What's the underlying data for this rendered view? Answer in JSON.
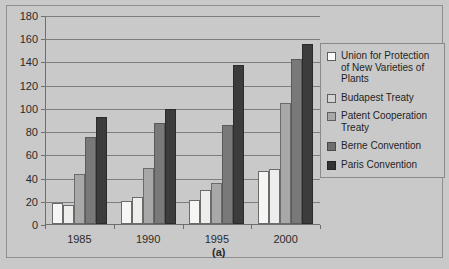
{
  "chart_data": {
    "type": "bar",
    "title": "",
    "subtitle": "",
    "caption": "(a)",
    "xlabel": "",
    "ylabel": "",
    "categories": [
      "1985",
      "1990",
      "1995",
      "2000"
    ],
    "ylim": [
      0,
      180
    ],
    "ytick_step": 20,
    "yticks": [
      "0",
      "20",
      "40",
      "60",
      "80",
      "100",
      "120",
      "140",
      "160",
      "180"
    ],
    "grid": true,
    "legend_position": "right",
    "series": [
      {
        "name": "Union for Protection of New Varieties of Plants",
        "color": "#f6f6f4",
        "values": [
          18,
          20,
          21,
          46
        ]
      },
      {
        "name": "Budapest Treaty",
        "color": "#ededeb",
        "values": [
          16,
          23,
          29,
          47
        ]
      },
      {
        "name": "Patent Cooperation Treaty",
        "color": "#a8a8a8",
        "values": [
          43,
          48,
          35,
          104
        ]
      },
      {
        "name": "Berne Convention",
        "color": "#797979",
        "values": [
          75,
          87,
          85,
          142
        ]
      },
      {
        "name": "Paris Convention",
        "color": "#3c3c3c",
        "values": [
          92,
          99,
          137,
          155
        ]
      }
    ]
  },
  "legend": {
    "items": [
      {
        "label": "Union for Protection of New Varieties of Plants"
      },
      {
        "label": "Budapest Treaty"
      },
      {
        "label": "Patent Cooperation Treaty"
      },
      {
        "label": "Berne Convention"
      },
      {
        "label": "Paris Convention"
      }
    ]
  }
}
